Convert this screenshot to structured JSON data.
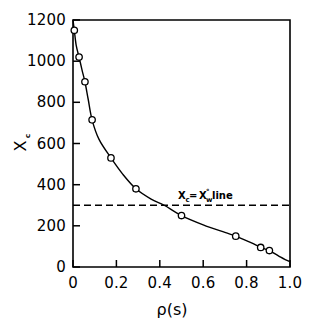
{
  "chart_data": {
    "type": "line",
    "title": "",
    "xlabel": "ρ(s)",
    "ylabel": "Xᴄ",
    "ylabel_main": "X",
    "ylabel_sub": "c",
    "xlim": [
      0,
      1.0
    ],
    "ylim": [
      0,
      1200
    ],
    "grid": false,
    "legend": "none",
    "x_ticks": [
      0,
      0.2,
      0.4,
      0.6,
      0.8,
      1.0
    ],
    "x_tick_labels": [
      "0",
      "0.2",
      "0.4",
      "0.6",
      "0.8",
      "1.0"
    ],
    "y_ticks": [
      0,
      200,
      400,
      600,
      800,
      1000,
      1200
    ],
    "y_tick_labels": [
      "0",
      "200",
      "400",
      "600",
      "800",
      "1000",
      "1200"
    ],
    "series": [
      {
        "name": "Xc vs rho",
        "marker": "open-circle",
        "x": [
          0.006,
          0.028,
          0.055,
          0.088,
          0.175,
          0.29,
          0.5,
          0.75,
          0.865,
          0.905
        ],
        "y": [
          1150,
          1020,
          900,
          715,
          530,
          380,
          250,
          150,
          95,
          80
        ]
      }
    ],
    "curve_x": [
      0.0,
      0.006,
      0.015,
      0.028,
      0.042,
      0.055,
      0.07,
      0.088,
      0.12,
      0.175,
      0.23,
      0.29,
      0.36,
      0.42,
      0.5,
      0.6,
      0.7,
      0.75,
      0.82,
      0.865,
      0.905,
      0.95,
      1.0
    ],
    "curve_y": [
      1200,
      1150,
      1075,
      1020,
      955,
      900,
      815,
      715,
      620,
      530,
      450,
      380,
      330,
      300,
      250,
      205,
      168,
      150,
      118,
      95,
      80,
      52,
      25
    ],
    "annotations": [
      {
        "name": "reference-line-label",
        "text_main_1": "X",
        "text_sub_1": "c",
        "text_eq": " = ",
        "text_main_2": "X",
        "text_sub_2": "w",
        "text_sup_2": "°",
        "text_tail": " line",
        "full_text": "Xᴄ = Xᴡ° line",
        "x": 0.48,
        "y": 355
      }
    ],
    "reference_lines": [
      {
        "name": "xc-equals-xw-line",
        "orientation": "horizontal",
        "value": 300,
        "style": "dashed"
      }
    ]
  }
}
